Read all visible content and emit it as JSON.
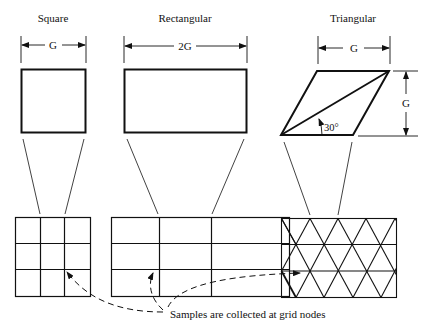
{
  "figure": {
    "panels": [
      {
        "id": "square",
        "title": "Square",
        "dimension_label": "G"
      },
      {
        "id": "rectangular",
        "title": "Rectangular",
        "dimension_label": "2G"
      },
      {
        "id": "triangular",
        "title": "Triangular",
        "dimension_label": "G",
        "height_label": "G",
        "angle_label": "30°"
      }
    ],
    "annotation": "Samples are collected at grid nodes",
    "colors": {
      "ink": "#111111",
      "background": "#ffffff"
    }
  }
}
